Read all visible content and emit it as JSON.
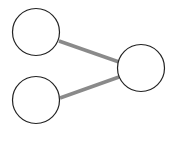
{
  "diagram": {
    "type": "graph",
    "nodes": [
      {
        "id": "node-top-left",
        "cx": 36,
        "cy": 32,
        "r": 24,
        "label": ""
      },
      {
        "id": "node-bottom-left",
        "cx": 36,
        "cy": 100,
        "r": 24,
        "label": ""
      },
      {
        "id": "node-right",
        "cx": 141,
        "cy": 68,
        "r": 24,
        "label": ""
      }
    ],
    "edges": [
      {
        "from": "node-top-left",
        "to": "node-right",
        "x1": 59,
        "y1": 41,
        "x2": 119,
        "y2": 62
      },
      {
        "from": "node-bottom-left",
        "to": "node-right",
        "x1": 60,
        "y1": 98,
        "x2": 119,
        "y2": 77
      }
    ],
    "colors": {
      "background": "#ffffff",
      "node_stroke": "#222222",
      "node_fill": "#ffffff",
      "edge": "#8a8a8a"
    }
  }
}
